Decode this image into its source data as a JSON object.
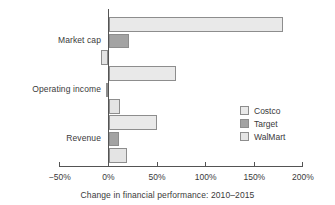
{
  "chart_data": {
    "type": "bar",
    "orientation": "horizontal",
    "title": "",
    "subtitle": "",
    "xlabel": "Change in financial performance: 2010–2015",
    "ylabel": "",
    "categories": [
      "Market cap",
      "Operating income",
      "Revenue"
    ],
    "series": [
      {
        "name": "Costco",
        "color": "#e9e9e9",
        "values": [
          180,
          69,
          50
        ]
      },
      {
        "name": "Target",
        "color": "#a3a3a3",
        "values": [
          21,
          -3,
          11
        ]
      },
      {
        "name": "WalMart",
        "color": "#e4e4e4",
        "values": [
          -8,
          12,
          19
        ]
      }
    ],
    "xlim": [
      -50,
      200
    ],
    "xticks": [
      -50,
      0,
      50,
      100,
      150,
      200
    ],
    "xtick_labels": [
      "−50%",
      "0%",
      "50%",
      "100%",
      "150%",
      "200%"
    ],
    "grid": false,
    "legend_position": "inside-right",
    "legend_entries": [
      "Costco",
      "Target",
      "WalMart"
    ],
    "axis_color": "#545454",
    "bar_edge_color": "#8d8d8d",
    "background": "#ffffff"
  }
}
